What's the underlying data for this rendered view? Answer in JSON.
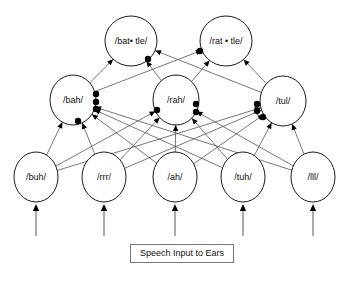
{
  "diagram": {
    "caption": {
      "text": "Speech Input to Ears",
      "x": 130,
      "y": 244,
      "width": 104,
      "height": 19
    },
    "colors": {
      "node_stroke": "#1a1a1a",
      "node_fill": "#ffffff",
      "connection": "#555555",
      "synapse_dot": "#000000",
      "text": "#111111",
      "background": "#ffffff"
    },
    "layers": [
      {
        "name": "word-layer",
        "nodes": [
          {
            "id": "battle",
            "label": "/bat• tle/",
            "cx": 131,
            "cy": 41,
            "rx": 26,
            "ry": 25
          },
          {
            "id": "rattle",
            "label": "/rat • tle/",
            "cx": 226,
            "cy": 41,
            "rx": 26,
            "ry": 25
          }
        ]
      },
      {
        "name": "syllable-layer",
        "nodes": [
          {
            "id": "bah",
            "label": "/bah/",
            "cx": 73,
            "cy": 100,
            "rx": 23,
            "ry": 25
          },
          {
            "id": "rah",
            "label": "/rah/",
            "cx": 176,
            "cy": 100,
            "rx": 23,
            "ry": 25
          },
          {
            "id": "tul",
            "label": "/tul/",
            "cx": 283,
            "cy": 101,
            "rx": 23,
            "ry": 25
          }
        ]
      },
      {
        "name": "phoneme-layer",
        "nodes": [
          {
            "id": "buh",
            "label": "/buh/",
            "cx": 36,
            "cy": 177,
            "rx": 22,
            "ry": 25
          },
          {
            "id": "rrr",
            "label": "/rrr/",
            "cx": 104,
            "cy": 177,
            "rx": 22,
            "ry": 25
          },
          {
            "id": "ah",
            "label": "/ah/",
            "cx": 175,
            "cy": 177,
            "rx": 22,
            "ry": 25
          },
          {
            "id": "tuh",
            "label": "/tuh/",
            "cx": 243,
            "cy": 177,
            "rx": 22,
            "ry": 25
          },
          {
            "id": "lll",
            "label": "/lll/",
            "cx": 313,
            "cy": 177,
            "rx": 22,
            "ry": 25
          }
        ]
      }
    ],
    "input_arrows": [
      {
        "x": 36,
        "y_from": 236,
        "y_to": 204
      },
      {
        "x": 104,
        "y_from": 236,
        "y_to": 204
      },
      {
        "x": 175,
        "y_from": 236,
        "y_to": 204
      },
      {
        "x": 243,
        "y_from": 236,
        "y_to": 204
      },
      {
        "x": 313,
        "y_from": 236,
        "y_to": 204
      }
    ],
    "connections_phoneme_to_syllable": [
      {
        "from": "buh",
        "to": "bah"
      },
      {
        "from": "buh",
        "to": "rah"
      },
      {
        "from": "buh",
        "to": "tul"
      },
      {
        "from": "rrr",
        "to": "bah"
      },
      {
        "from": "rrr",
        "to": "rah"
      },
      {
        "from": "rrr",
        "to": "tul"
      },
      {
        "from": "ah",
        "to": "bah"
      },
      {
        "from": "ah",
        "to": "rah"
      },
      {
        "from": "ah",
        "to": "tul"
      },
      {
        "from": "tuh",
        "to": "bah"
      },
      {
        "from": "tuh",
        "to": "rah"
      },
      {
        "from": "tuh",
        "to": "tul"
      },
      {
        "from": "lll",
        "to": "bah"
      },
      {
        "from": "lll",
        "to": "rah"
      },
      {
        "from": "lll",
        "to": "tul"
      }
    ],
    "connections_syllable_to_word": [
      {
        "from": "bah",
        "to": "battle"
      },
      {
        "from": "bah",
        "to": "rattle"
      },
      {
        "from": "rah",
        "to": "battle"
      },
      {
        "from": "rah",
        "to": "rattle"
      },
      {
        "from": "tul",
        "to": "battle"
      },
      {
        "from": "tul",
        "to": "rattle"
      }
    ],
    "synapse_dots": [
      {
        "cx": 96,
        "cy": 94,
        "r": 3.2
      },
      {
        "cx": 96,
        "cy": 102,
        "r": 3.2
      },
      {
        "cx": 96,
        "cy": 109,
        "r": 3.2
      },
      {
        "cx": 78,
        "cy": 121,
        "r": 3.2
      },
      {
        "cx": 157,
        "cy": 110,
        "r": 3.2
      },
      {
        "cx": 196,
        "cy": 104,
        "r": 3.2
      },
      {
        "cx": 196,
        "cy": 112,
        "r": 3.2
      },
      {
        "cx": 257,
        "cy": 104,
        "r": 3.2
      },
      {
        "cx": 257,
        "cy": 111,
        "r": 3.2
      },
      {
        "cx": 263,
        "cy": 117,
        "r": 3.2
      },
      {
        "cx": 148,
        "cy": 59,
        "r": 3.2
      },
      {
        "cx": 200,
        "cy": 51,
        "r": 3.2
      }
    ]
  }
}
